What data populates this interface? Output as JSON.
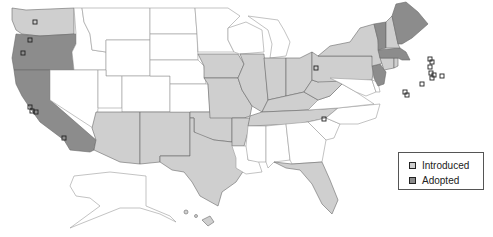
{
  "legend": {
    "items": [
      {
        "label": "Introduced",
        "color": "#cfcfcf"
      },
      {
        "label": "Adopted",
        "color": "#8c8c8c"
      }
    ]
  },
  "colors": {
    "none": "#ffffff",
    "introduced": "#cfcfcf",
    "adopted": "#8c8c8c",
    "border": "#6a6a6a",
    "marker": "#222222"
  },
  "states": {
    "adopted": [
      "Oregon",
      "California",
      "New Jersey",
      "Vermont",
      "Maine",
      "Massachusetts"
    ],
    "introduced": [
      "Washington",
      "Arizona",
      "New Mexico",
      "Texas",
      "Oklahoma",
      "Iowa",
      "Missouri",
      "Arkansas",
      "Illinois",
      "Indiana",
      "Ohio",
      "Kentucky",
      "Tennessee",
      "West Virginia",
      "Pennsylvania",
      "New York",
      "New Hampshire",
      "Connecticut",
      "Rhode Island",
      "Florida",
      "Hawaii"
    ],
    "none": [
      "Idaho",
      "Montana",
      "Wyoming",
      "Nevada",
      "Utah",
      "Colorado",
      "North Dakota",
      "South Dakota",
      "Nebraska",
      "Kansas",
      "Minnesota",
      "Wisconsin",
      "Michigan",
      "Louisiana",
      "Mississippi",
      "Alabama",
      "Georgia",
      "South Carolina",
      "North Carolina",
      "Virginia",
      "Maryland",
      "Delaware",
      "Alaska"
    ]
  }
}
